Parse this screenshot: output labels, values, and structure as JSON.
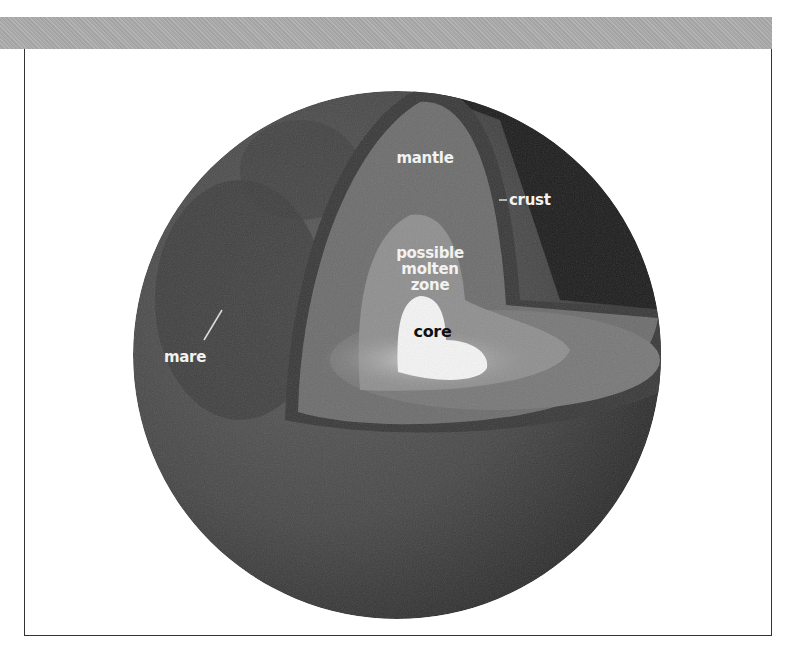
{
  "figure": {
    "labels": {
      "mantle": "mantle",
      "crust": "crust",
      "molten_line1": "possible",
      "molten_line2": "molten",
      "molten_line3": "zone",
      "core": "core",
      "mare": "mare"
    },
    "colors": {
      "band": "#aaaaaa",
      "frame": "#333333",
      "surface": "#4a4a4a",
      "dark_side": "#1e1e1e",
      "crust": "#3c3c3c",
      "mantle": "#6e6e6e",
      "molten_zone": "#8d8d8d",
      "core": "#f4f4f4"
    }
  }
}
